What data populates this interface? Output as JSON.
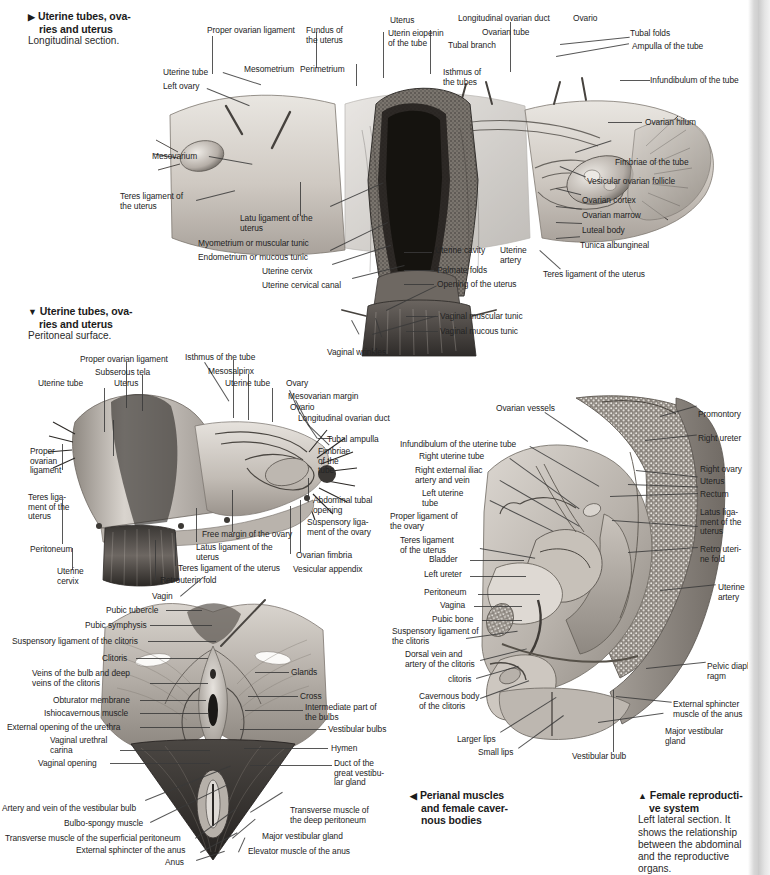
{
  "page": {
    "width": 770,
    "height": 875,
    "background": "#ffffff",
    "ink": "#242424"
  },
  "captions": [
    {
      "id": "fig1-caption",
      "arrow": "▶",
      "title_lines": [
        "Uterine tubes, ova-",
        "ries and uterus"
      ],
      "subtitle_lines": [
        "Longitudinal section."
      ]
    },
    {
      "id": "fig2-caption",
      "arrow": "▼",
      "title_lines": [
        "Uterine tubes, ova-",
        "ries and uterus"
      ],
      "subtitle_lines": [
        "Peritoneal surface."
      ]
    },
    {
      "id": "fig3-caption",
      "arrow": "◀",
      "title_lines": [
        "Perianal muscles",
        "and female caver-",
        "nous bodies"
      ],
      "subtitle_lines": []
    },
    {
      "id": "fig4-caption",
      "arrow": "▲",
      "title_lines": [
        "Female reproducti-",
        "ve system"
      ],
      "subtitle_lines": [
        "Left lateral section. It",
        "shows the relationship",
        "between the abdominal",
        "and the reproductive",
        "organs."
      ]
    }
  ],
  "figure1": {
    "name": "uterine-tubes-ovaries-uterus-longitudinal-section",
    "labels": [
      {
        "text": "Proper ovarian ligament",
        "x": 207,
        "y": 26,
        "align": "left"
      },
      {
        "text": "Fundus of\nthe uterus",
        "x": 306,
        "y": 26,
        "align": "left"
      },
      {
        "text": "Uterus",
        "x": 390,
        "y": 16,
        "align": "left"
      },
      {
        "text": "Uterin eiopenin\nof the tube",
        "x": 388,
        "y": 29,
        "align": "left"
      },
      {
        "text": "Longitudinal ovarian duct",
        "x": 458,
        "y": 14,
        "align": "left"
      },
      {
        "text": "Ovario",
        "x": 573,
        "y": 14,
        "align": "left"
      },
      {
        "text": "Ovarian tube",
        "x": 482,
        "y": 28,
        "align": "left"
      },
      {
        "text": "Tubal branch",
        "x": 448,
        "y": 41,
        "align": "left"
      },
      {
        "text": "Tubal folds",
        "x": 630,
        "y": 29,
        "align": "left"
      },
      {
        "text": "Ampulla of the tube",
        "x": 632,
        "y": 42,
        "align": "left"
      },
      {
        "text": "Mesometrium",
        "x": 244,
        "y": 65,
        "align": "left"
      },
      {
        "text": "Perimetrium",
        "x": 300,
        "y": 65,
        "align": "left"
      },
      {
        "text": "Isthmus of\nthe tubes",
        "x": 443,
        "y": 68,
        "align": "left"
      },
      {
        "text": "Infundibulum of the tube",
        "x": 650,
        "y": 76,
        "align": "left"
      },
      {
        "text": "Uterine tube",
        "x": 163,
        "y": 68,
        "align": "left"
      },
      {
        "text": "Left ovary",
        "x": 163,
        "y": 82,
        "align": "left"
      },
      {
        "text": "Ovarian hilum",
        "x": 645,
        "y": 118,
        "align": "left"
      },
      {
        "text": "Mesovarium",
        "x": 152,
        "y": 152,
        "align": "left"
      },
      {
        "text": "Fimbriae of the tube",
        "x": 615,
        "y": 158,
        "align": "left"
      },
      {
        "text": "Vesicular ovarian follicle",
        "x": 587,
        "y": 177,
        "align": "left"
      },
      {
        "text": "Teres ligament of\nthe uterus",
        "x": 120,
        "y": 192,
        "align": "left"
      },
      {
        "text": "Ovarian cortex",
        "x": 582,
        "y": 196,
        "align": "left"
      },
      {
        "text": "Ovarian marrow",
        "x": 582,
        "y": 211,
        "align": "left"
      },
      {
        "text": "Latu ligament of the\nuterus",
        "x": 240,
        "y": 214,
        "align": "left"
      },
      {
        "text": "Luteal body",
        "x": 582,
        "y": 226,
        "align": "left"
      },
      {
        "text": "Myometrium or muscular tunic",
        "x": 198,
        "y": 239,
        "align": "left"
      },
      {
        "text": "Tunica albungineal",
        "x": 580,
        "y": 241,
        "align": "left"
      },
      {
        "text": "Endometrium or mucous tunic",
        "x": 198,
        "y": 253,
        "align": "left"
      },
      {
        "text": "Uterine cavity",
        "x": 435,
        "y": 246,
        "align": "left"
      },
      {
        "text": "Uterine\nartery",
        "x": 500,
        "y": 246,
        "align": "left"
      },
      {
        "text": "Uterine cervix",
        "x": 262,
        "y": 267,
        "align": "left"
      },
      {
        "text": "Palmate folds",
        "x": 437,
        "y": 266,
        "align": "left"
      },
      {
        "text": "Teres ligament of the uterus",
        "x": 543,
        "y": 270,
        "align": "left"
      },
      {
        "text": "Uterine cervical canal",
        "x": 262,
        "y": 281,
        "align": "left"
      },
      {
        "text": "Opening of the uterus",
        "x": 437,
        "y": 280,
        "align": "left"
      },
      {
        "text": "Vaginal muscular tunic",
        "x": 440,
        "y": 312,
        "align": "left"
      },
      {
        "text": "Vaginal mucous tunic",
        "x": 440,
        "y": 327,
        "align": "left"
      },
      {
        "text": "Vaginal wrinkles",
        "x": 327,
        "y": 348,
        "align": "left"
      }
    ]
  },
  "figure2": {
    "name": "uterine-tubes-ovaries-uterus-peritoneal-surface",
    "labels": [
      {
        "text": "Proper ovarian ligament",
        "x": 80,
        "y": 355,
        "align": "left"
      },
      {
        "text": "Isthmus of the tube",
        "x": 185,
        "y": 353,
        "align": "left"
      },
      {
        "text": "Subserous tela",
        "x": 95,
        "y": 368,
        "align": "left"
      },
      {
        "text": "Mesosalpinx",
        "x": 208,
        "y": 367,
        "align": "left"
      },
      {
        "text": "Uterine tube",
        "x": 38,
        "y": 379,
        "align": "left"
      },
      {
        "text": "Uterus",
        "x": 114,
        "y": 379,
        "align": "left"
      },
      {
        "text": "Uterine tube",
        "x": 225,
        "y": 379,
        "align": "left"
      },
      {
        "text": "Ovary",
        "x": 286,
        "y": 379,
        "align": "left"
      },
      {
        "text": "Mesovarian margin",
        "x": 288,
        "y": 392,
        "align": "left"
      },
      {
        "text": "Ovario",
        "x": 290,
        "y": 403,
        "align": "left"
      },
      {
        "text": "Longitudinal ovarian duct",
        "x": 298,
        "y": 414,
        "align": "left"
      },
      {
        "text": "Tubal ampulla",
        "x": 327,
        "y": 435,
        "align": "left"
      },
      {
        "text": "Proper\novarian\nligament",
        "x": 30,
        "y": 447,
        "align": "left"
      },
      {
        "text": "Fimbriae\nof the\ntube",
        "x": 318,
        "y": 447,
        "align": "left"
      },
      {
        "text": "Teres liga-\nment of the\nuterus",
        "x": 28,
        "y": 493,
        "align": "left"
      },
      {
        "text": "Abdominal tubal\nopening",
        "x": 313,
        "y": 496,
        "align": "left"
      },
      {
        "text": "Suspensory liga-\nment of the ovary",
        "x": 307,
        "y": 518,
        "align": "left"
      },
      {
        "text": "Free margin of the ovary",
        "x": 202,
        "y": 530,
        "align": "left"
      },
      {
        "text": "Peritoneum",
        "x": 30,
        "y": 545,
        "align": "left"
      },
      {
        "text": "Latus ligament of the\nuterus",
        "x": 196,
        "y": 543,
        "align": "left"
      },
      {
        "text": "Ovarian fimbria",
        "x": 296,
        "y": 551,
        "align": "left"
      },
      {
        "text": "Uterine\ncervix",
        "x": 57,
        "y": 567,
        "align": "left"
      },
      {
        "text": "Teres ligament of the uterus",
        "x": 178,
        "y": 564,
        "align": "left"
      },
      {
        "text": "Vesicular appendix",
        "x": 293,
        "y": 565,
        "align": "left"
      },
      {
        "text": "Retrouterin fold",
        "x": 160,
        "y": 576,
        "align": "left"
      },
      {
        "text": "Vagin",
        "x": 152,
        "y": 592,
        "align": "left"
      }
    ]
  },
  "figure3": {
    "name": "perianal-muscles-and-female-cavernous-bodies",
    "labels": [
      {
        "text": "Pubic tubercle",
        "x": 106,
        "y": 606,
        "align": "left"
      },
      {
        "text": "Pubic symphysis",
        "x": 85,
        "y": 621,
        "align": "left"
      },
      {
        "text": "Suspensory ligament of the clitoris",
        "x": 12,
        "y": 637,
        "align": "left"
      },
      {
        "text": "Clitoris",
        "x": 102,
        "y": 654,
        "align": "left"
      },
      {
        "text": "Glands",
        "x": 291,
        "y": 668,
        "align": "left"
      },
      {
        "text": "Veins of the bulb and deep\nveins of the clitoris",
        "x": 32,
        "y": 669,
        "align": "left"
      },
      {
        "text": "Cross",
        "x": 300,
        "y": 692,
        "align": "left"
      },
      {
        "text": "Obturator membrane",
        "x": 53,
        "y": 696,
        "align": "left"
      },
      {
        "text": "Intermediate part of\nthe bulbs",
        "x": 305,
        "y": 703,
        "align": "left"
      },
      {
        "text": "Ishiocavernous muscle",
        "x": 44,
        "y": 709,
        "align": "left"
      },
      {
        "text": "External opening of the urethra",
        "x": 7,
        "y": 723,
        "align": "left"
      },
      {
        "text": "Vestibular bulbs",
        "x": 328,
        "y": 725,
        "align": "left"
      },
      {
        "text": "Vaginal urethral\ncarina",
        "x": 50,
        "y": 736,
        "align": "left"
      },
      {
        "text": "Hymen",
        "x": 331,
        "y": 744,
        "align": "left"
      },
      {
        "text": "Vaginal opening",
        "x": 38,
        "y": 759,
        "align": "left"
      },
      {
        "text": "Duct of the\ngreat vestibu-\nlar gland",
        "x": 334,
        "y": 759,
        "align": "left"
      },
      {
        "text": "Artery and vein of the vestibular bulb",
        "x": 2,
        "y": 804,
        "align": "left"
      },
      {
        "text": "Transverse muscle of\nthe deep peritoneum",
        "x": 290,
        "y": 806,
        "align": "left"
      },
      {
        "text": "Bulbo-spongy muscle",
        "x": 64,
        "y": 819,
        "align": "left"
      },
      {
        "text": "Transverse muscle of the superficial peritoneum",
        "x": 5,
        "y": 834,
        "align": "left"
      },
      {
        "text": "Major vestibular gland",
        "x": 262,
        "y": 832,
        "align": "left"
      },
      {
        "text": "External sphincter of the anus",
        "x": 76,
        "y": 846,
        "align": "left"
      },
      {
        "text": "Elevator muscle of the anus",
        "x": 248,
        "y": 847,
        "align": "left"
      },
      {
        "text": "Anus",
        "x": 165,
        "y": 858,
        "align": "left"
      }
    ]
  },
  "figure4": {
    "name": "female-reproductive-system-left-lateral-section",
    "labels": [
      {
        "text": "Ovarian vessels",
        "x": 496,
        "y": 404,
        "align": "left"
      },
      {
        "text": "Promontory",
        "x": 698,
        "y": 410,
        "align": "left"
      },
      {
        "text": "Right ureter",
        "x": 698,
        "y": 434,
        "align": "left"
      },
      {
        "text": "Infundibulum of the uterine tube",
        "x": 400,
        "y": 440,
        "align": "left"
      },
      {
        "text": "Right uterine tube",
        "x": 419,
        "y": 452,
        "align": "left"
      },
      {
        "text": "Right external iliac\nartery and vein",
        "x": 415,
        "y": 466,
        "align": "left"
      },
      {
        "text": "Right ovary",
        "x": 700,
        "y": 465,
        "align": "left"
      },
      {
        "text": "Uterus",
        "x": 700,
        "y": 477,
        "align": "left"
      },
      {
        "text": "Left uterine\ntube",
        "x": 422,
        "y": 489,
        "align": "left"
      },
      {
        "text": "Rectum",
        "x": 700,
        "y": 490,
        "align": "left"
      },
      {
        "text": "Proper ligament of\nthe ovary",
        "x": 390,
        "y": 512,
        "align": "left"
      },
      {
        "text": "Latus liga-\nment of the\nuterus",
        "x": 700,
        "y": 508,
        "align": "left"
      },
      {
        "text": "Teres ligament\nof the uterus",
        "x": 400,
        "y": 536,
        "align": "left"
      },
      {
        "text": "Retro uteri-\nne fold",
        "x": 700,
        "y": 545,
        "align": "left"
      },
      {
        "text": "Bladder",
        "x": 429,
        "y": 555,
        "align": "left"
      },
      {
        "text": "Left ureter",
        "x": 424,
        "y": 570,
        "align": "left"
      },
      {
        "text": "Peritoneum",
        "x": 424,
        "y": 588,
        "align": "left"
      },
      {
        "text": "Uterine\nartery",
        "x": 718,
        "y": 583,
        "align": "left"
      },
      {
        "text": "Vagina",
        "x": 440,
        "y": 601,
        "align": "left"
      },
      {
        "text": "Pubic bone",
        "x": 432,
        "y": 615,
        "align": "left"
      },
      {
        "text": "Suspensory ligament of\nthe clitoris",
        "x": 392,
        "y": 627,
        "align": "left"
      },
      {
        "text": "Dorsal vein and\nartery of the clitoris",
        "x": 405,
        "y": 650,
        "align": "left"
      },
      {
        "text": "Pelvic diaph-\nragm",
        "x": 707,
        "y": 662,
        "align": "left"
      },
      {
        "text": "clitoris",
        "x": 448,
        "y": 675,
        "align": "left"
      },
      {
        "text": "Cavernous body\nof the clitoris",
        "x": 419,
        "y": 692,
        "align": "left"
      },
      {
        "text": "External sphincter\nmuscle of the anus",
        "x": 673,
        "y": 700,
        "align": "left"
      },
      {
        "text": "Major vestibular\ngland",
        "x": 665,
        "y": 727,
        "align": "left"
      },
      {
        "text": "Larger lips",
        "x": 457,
        "y": 735,
        "align": "left"
      },
      {
        "text": "Small lips",
        "x": 478,
        "y": 748,
        "align": "left"
      },
      {
        "text": "Vestibular bulb",
        "x": 572,
        "y": 752,
        "align": "left"
      }
    ]
  }
}
